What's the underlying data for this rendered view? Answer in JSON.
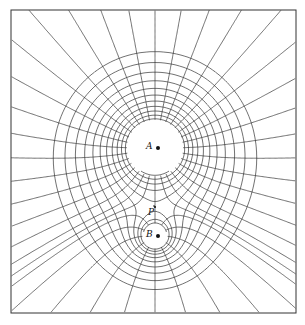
{
  "figure": {
    "frame": {
      "x": 11,
      "y": 10,
      "w": 285,
      "h": 303
    },
    "stroke_color": "#333333",
    "background": "#ffffff",
    "charges": [
      {
        "label": "A",
        "x": 155,
        "y": 148,
        "q": 4,
        "clear_radius": 27
      },
      {
        "label": "B",
        "x": 155,
        "y": 236,
        "q": 1,
        "clear_radius": 12
      }
    ],
    "neutral_point": {
      "label": "P",
      "x": 152,
      "y": 212
    },
    "labels": {
      "A": "A",
      "B": "B",
      "P": "P"
    }
  }
}
